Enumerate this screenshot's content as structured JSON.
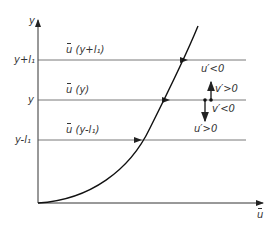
{
  "diagram": {
    "axes": {
      "y_label": "y",
      "x_label": "u",
      "x_label_overbar": true
    },
    "levels": [
      {
        "tick_label": "y+l₁",
        "line_label_prefix": "u",
        "line_label_arg": "(y+l₁)"
      },
      {
        "tick_label": "y",
        "line_label_prefix": "u",
        "line_label_arg": "(y)"
      },
      {
        "tick_label": "y-l₁",
        "line_label_prefix": "u",
        "line_label_arg": "(y-l₁)"
      }
    ],
    "annotations": {
      "upper_u": "u′<0",
      "upper_v": "v′>0",
      "lower_v": "v′<0",
      "lower_u": "u′>0"
    },
    "colors": {
      "line": "#333333",
      "curve": "#111111",
      "background": "#ffffff"
    }
  }
}
